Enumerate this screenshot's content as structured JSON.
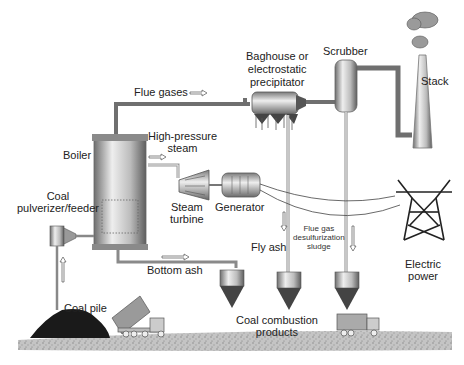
{
  "diagram": {
    "components": {
      "boiler": "Boiler",
      "coal_pulverizer": [
        "Coal",
        "pulverizer/feeder"
      ],
      "coal_pile": "Coal pile",
      "steam_turbine": [
        "Steam",
        "turbine"
      ],
      "generator": "Generator",
      "baghouse": [
        "Baghouse or",
        "electrostatic",
        "precipitator"
      ],
      "scrubber": "Scrubber",
      "stack": "Stack",
      "electric_power": [
        "Electric",
        "power"
      ],
      "coal_combustion_products": [
        "Coal combustion",
        "products"
      ]
    },
    "flows": {
      "flue_gases": "Flue gases",
      "high_pressure_steam": [
        "High-pressure",
        "steam"
      ],
      "bottom_ash": "Bottom ash",
      "fly_ash": "Fly ash",
      "fgd_sludge": [
        "Flue gas",
        "desulfurization",
        "sludge"
      ]
    },
    "colors": {
      "pipe": "#6f6f6f",
      "equipment_light": "#e6e6e6",
      "equipment_dark": "#7a7a7a",
      "coal": "#1a1a1a",
      "ground": "#bdbdbd",
      "text": "#222222"
    }
  }
}
